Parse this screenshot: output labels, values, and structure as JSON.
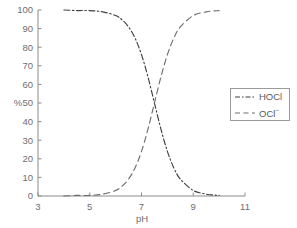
{
  "chart_data": {
    "type": "line",
    "title": "",
    "xlabel": "pH",
    "ylabel": "%",
    "xlim": [
      3,
      11
    ],
    "ylim": [
      0,
      100
    ],
    "xticks": [
      3,
      5,
      7,
      9,
      11
    ],
    "yticks": [
      0,
      10,
      20,
      30,
      40,
      50,
      60,
      70,
      80,
      90,
      100
    ],
    "grid": false,
    "legend_position": "right",
    "pKa": 7.5,
    "series": [
      {
        "name": "HOCl",
        "linestyle": "dashdot",
        "color": "#3f4042",
        "x": [
          4.0,
          4.5,
          5.0,
          5.5,
          6.0,
          6.25,
          6.5,
          6.75,
          7.0,
          7.25,
          7.5,
          7.75,
          8.0,
          8.25,
          8.5,
          9.0,
          9.5,
          10.0
        ],
        "values": [
          100,
          99.7,
          99.7,
          99,
          97,
          94.7,
          90.9,
          84.9,
          76,
          64,
          50,
          36,
          24,
          15.1,
          9.1,
          3,
          1,
          0.3
        ]
      },
      {
        "name": "OCl-",
        "linestyle": "dashed",
        "color": "#6d6e71",
        "x": [
          4.0,
          4.5,
          5.0,
          5.5,
          6.0,
          6.25,
          6.5,
          6.75,
          7.0,
          7.25,
          7.5,
          7.75,
          8.0,
          8.25,
          8.5,
          9.0,
          9.5,
          10.0
        ],
        "values": [
          0,
          0.3,
          0.3,
          1,
          3,
          5.3,
          9.1,
          15.1,
          24,
          36,
          50,
          64,
          76,
          84.9,
          90.9,
          97,
          99,
          99.7
        ]
      }
    ]
  },
  "axes": {
    "y_title": "%",
    "x_title": "pH",
    "y_tick_labels": [
      "0",
      "10",
      "20",
      "30",
      "40",
      "50",
      "60",
      "70",
      "80",
      "90",
      "100"
    ],
    "x_tick_labels": [
      "3",
      "5",
      "7",
      "9",
      "11"
    ]
  },
  "legend": {
    "entries": [
      {
        "label": "HOCl",
        "style": "dashdot",
        "color": "#3f4042"
      },
      {
        "label": "OCl",
        "charge": "−",
        "style": "dashed",
        "color": "#6d6e71"
      }
    ]
  },
  "colors": {
    "background": "#ffffff",
    "axis": "#8a8b8d",
    "text": "#6d6e71",
    "hocl": "#3f4042",
    "ocl": "#6d6e71",
    "legend_border": "#9a9b9d"
  }
}
